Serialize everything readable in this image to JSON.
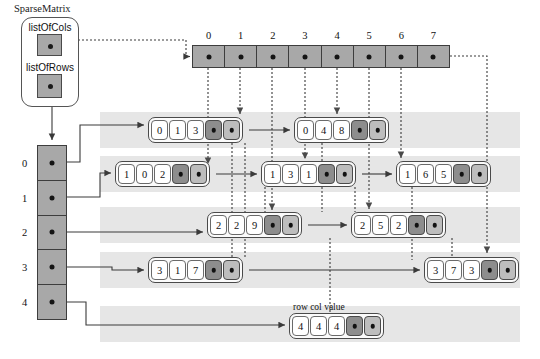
{
  "diagram": {
    "title": "SparseMatrix",
    "container": {
      "label": "SparseMatrix",
      "fields": [
        {
          "name": "listOfCols",
          "label": "listOfCols"
        },
        {
          "name": "listOfRows",
          "label": "listOfRows"
        }
      ]
    },
    "column_array": {
      "name": "listOfCols-array",
      "indices": [
        "0",
        "1",
        "2",
        "3",
        "4",
        "5",
        "6",
        "7"
      ]
    },
    "row_array": {
      "name": "listOfRows-array",
      "indices": [
        "0",
        "1",
        "2",
        "3",
        "4"
      ]
    },
    "node_field_legend": {
      "row": "row",
      "col": "col",
      "value": "value",
      "text": "row col value"
    },
    "rows": [
      {
        "row_index": "0",
        "nodes": [
          {
            "row": "0",
            "col": "1",
            "value": "3",
            "left": 148,
            "top": 117
          },
          {
            "row": "0",
            "col": "4",
            "value": "8",
            "left": 294,
            "top": 117
          }
        ]
      },
      {
        "row_index": "1",
        "nodes": [
          {
            "row": "1",
            "col": "0",
            "value": "2",
            "left": 115,
            "top": 161
          },
          {
            "row": "1",
            "col": "3",
            "value": "1",
            "left": 261,
            "top": 161
          },
          {
            "row": "1",
            "col": "6",
            "value": "5",
            "left": 396,
            "top": 161
          }
        ]
      },
      {
        "row_index": "2",
        "nodes": [
          {
            "row": "2",
            "col": "2",
            "value": "9",
            "left": 207,
            "top": 212
          },
          {
            "row": "2",
            "col": "5",
            "value": "2",
            "left": 351,
            "top": 212
          }
        ]
      },
      {
        "row_index": "3",
        "nodes": [
          {
            "row": "3",
            "col": "1",
            "value": "7",
            "left": 148,
            "top": 257
          },
          {
            "row": "3",
            "col": "7",
            "value": "3",
            "left": 424,
            "top": 257
          }
        ]
      },
      {
        "row_index": "4",
        "nodes": [
          {
            "row": "4",
            "col": "4",
            "value": "4",
            "left": 289,
            "top": 313
          }
        ]
      }
    ],
    "colors": {
      "array_fill": "#a8a8a8",
      "band_fill": "#e6e6e6",
      "pointer_dark": "#8d8d8d",
      "pointer_light": "#bdbdbd",
      "stroke": "#3d3d3d",
      "node_fill": "#fbfbfb"
    }
  }
}
